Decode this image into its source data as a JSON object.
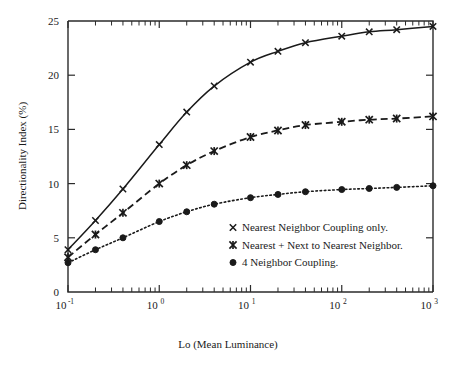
{
  "chart_data": {
    "type": "line",
    "title": "",
    "xlabel": "Lo (Mean Luminance)",
    "ylabel": "Directionality Index (%)",
    "xscale": "log",
    "yscale": "linear",
    "xlim": [
      0.1,
      1000
    ],
    "ylim": [
      0,
      25
    ],
    "grid": false,
    "legend_position": "center-right-inside",
    "x_tick_labels": [
      "10⁻¹",
      "10⁰",
      "10¹",
      "10²",
      "10³"
    ],
    "x_tick_mantissas": [
      "10",
      "10",
      "10",
      "10",
      "10"
    ],
    "x_tick_exponents": [
      "-1",
      "0",
      "1",
      "2",
      "3"
    ],
    "x_tick_values": [
      0.1,
      1,
      10,
      100,
      1000
    ],
    "y_tick_labels": [
      "0",
      "5",
      "10",
      "15",
      "20",
      "25"
    ],
    "y_tick_values": [
      0,
      5,
      10,
      15,
      20,
      25
    ],
    "series": [
      {
        "name": "Nearest Neighbor Coupling only.",
        "marker": "x-cross",
        "linestyle": "solid",
        "x": [
          0.1,
          0.2,
          0.4,
          1.0,
          2.0,
          4.0,
          10.0,
          20.0,
          40.0,
          100.0,
          200.0,
          400.0,
          1000.0
        ],
        "y": [
          3.9,
          6.6,
          9.5,
          13.6,
          16.6,
          19.0,
          21.2,
          22.2,
          23.0,
          23.6,
          24.0,
          24.2,
          24.5
        ]
      },
      {
        "name": "Nearest + Next to Nearest Neighbor.",
        "marker": "star-cross",
        "linestyle": "dashed",
        "x": [
          0.1,
          0.2,
          0.4,
          1.0,
          2.0,
          4.0,
          10.0,
          20.0,
          40.0,
          100.0,
          200.0,
          400.0,
          1000.0
        ],
        "y": [
          3.2,
          5.3,
          7.3,
          10.0,
          11.7,
          13.0,
          14.3,
          14.9,
          15.4,
          15.7,
          15.9,
          16.0,
          16.2
        ]
      },
      {
        "name": "4 Neighbor Coupling.",
        "marker": "filled-circle",
        "linestyle": "dotted",
        "x": [
          0.1,
          0.2,
          0.4,
          1.0,
          2.0,
          4.0,
          10.0,
          20.0,
          40.0,
          100.0,
          200.0,
          400.0,
          1000.0
        ],
        "y": [
          2.7,
          3.9,
          5.0,
          6.5,
          7.4,
          8.1,
          8.7,
          9.0,
          9.25,
          9.45,
          9.55,
          9.65,
          9.8
        ]
      }
    ],
    "legend_entries": [
      "Nearest Neighbor Coupling only.",
      "Nearest + Next to Nearest Neighbor.",
      "4 Neighbor Coupling."
    ],
    "colors": {
      "line": "#1a1a1a",
      "axis": "#2b2b2b",
      "background": "#ffffff"
    }
  }
}
